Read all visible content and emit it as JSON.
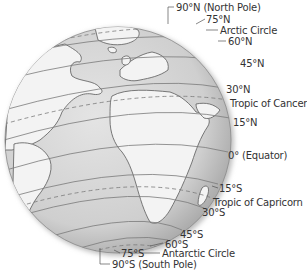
{
  "figure": {
    "colors": {
      "ocean": "#d6d6d6",
      "land": "#f2f2f2",
      "outline": "#6a6a6a",
      "text": "#333333"
    }
  },
  "labels": [
    {
      "id": "north-pole",
      "text": "90°N (North Pole)",
      "x": 176,
      "y": 2
    },
    {
      "id": "lat-75n",
      "text": "75°N",
      "x": 206,
      "y": 14
    },
    {
      "id": "arctic-circle",
      "text": "Arctic Circle",
      "x": 220,
      "y": 25
    },
    {
      "id": "lat-60n",
      "text": "60°N",
      "x": 228,
      "y": 36
    },
    {
      "id": "lat-45n",
      "text": "45°N",
      "x": 240,
      "y": 58
    },
    {
      "id": "lat-30n",
      "text": "30°N",
      "x": 226,
      "y": 84
    },
    {
      "id": "tropic-of-cancer",
      "text": "Tropic of Cancer",
      "x": 230,
      "y": 98
    },
    {
      "id": "lat-15n",
      "text": "15°N",
      "x": 233,
      "y": 117
    },
    {
      "id": "equator",
      "text": "0° (Equator)",
      "x": 228,
      "y": 150
    },
    {
      "id": "lat-15s",
      "text": "15°S",
      "x": 219,
      "y": 183
    },
    {
      "id": "tropic-of-capricorn",
      "text": "Tropic of Capricorn",
      "x": 213,
      "y": 197
    },
    {
      "id": "lat-30s",
      "text": "30°S",
      "x": 202,
      "y": 207
    },
    {
      "id": "lat-45s",
      "text": "45°S",
      "x": 180,
      "y": 229
    },
    {
      "id": "lat-60s",
      "text": "60°S",
      "x": 165,
      "y": 239
    },
    {
      "id": "antarctic-circle",
      "text": "Antarctic Circle",
      "x": 162,
      "y": 248
    },
    {
      "id": "lat-75s",
      "text": "75°S",
      "x": 121,
      "y": 248
    },
    {
      "id": "south-pole",
      "text": "90°S (South Pole)",
      "x": 112,
      "y": 259
    }
  ]
}
